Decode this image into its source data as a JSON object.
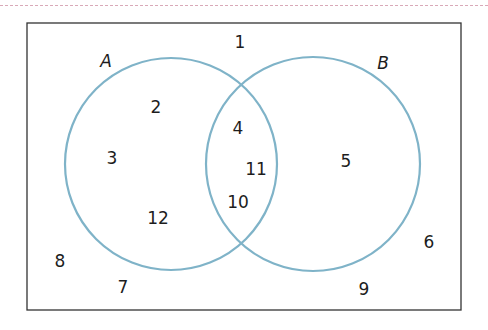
{
  "diagram": {
    "type": "venn",
    "colors": {
      "circle_stroke": "#7fb3c8",
      "frame": "#333333",
      "top_rule": "#d9a9b8"
    },
    "sets": [
      {
        "name": "A",
        "only": [
          "2",
          "3",
          "12"
        ]
      },
      {
        "name": "B",
        "only": [
          "5"
        ]
      }
    ],
    "intersection": [
      "4",
      "11",
      "10"
    ],
    "outside": [
      "1",
      "8",
      "7",
      "9",
      "6"
    ],
    "labels": {
      "set_a": "A",
      "set_b": "B",
      "n1": "1",
      "n2": "2",
      "n3": "3",
      "n4": "4",
      "n5": "5",
      "n6": "6",
      "n7": "7",
      "n8": "8",
      "n9": "9",
      "n10": "10",
      "n11": "11",
      "n12": "12"
    }
  }
}
